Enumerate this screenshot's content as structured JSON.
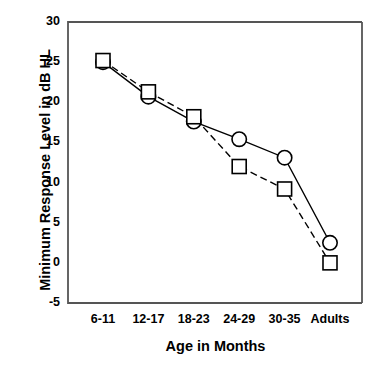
{
  "chart_data": {
    "type": "line",
    "title": "",
    "xlabel": "Age in Months",
    "ylabel": "Minimum Response Level in dB HL",
    "categories": [
      "6-11",
      "12-17",
      "18-23",
      "24-29",
      "30-35",
      "Adults"
    ],
    "ylim": [
      -5,
      30
    ],
    "yticks": [
      -5,
      0,
      5,
      10,
      15,
      20,
      25,
      30
    ],
    "ytick_labels": [
      "-5",
      "0",
      "5",
      "10",
      "15",
      "20",
      "25",
      "30"
    ],
    "grid": false,
    "legend": "none",
    "series": [
      {
        "name": "circle-series",
        "marker": "circle",
        "line_style": "solid",
        "color": "#000000",
        "values": [
          25.0,
          20.7,
          17.6,
          15.4,
          13.1,
          2.5
        ]
      },
      {
        "name": "square-series",
        "marker": "square",
        "line_style": "dashed",
        "color": "#000000",
        "values": [
          25.2,
          21.3,
          18.2,
          12.0,
          9.2,
          0.0
        ]
      }
    ],
    "axis_color": "#555555",
    "background": "#ffffff"
  }
}
